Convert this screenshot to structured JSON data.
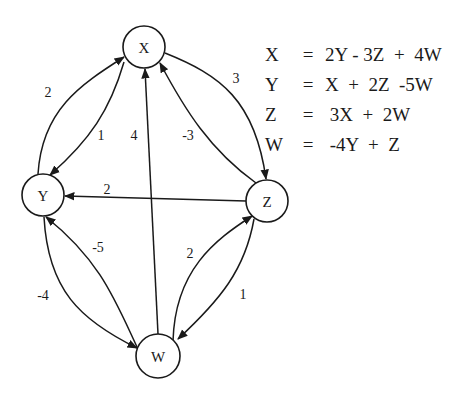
{
  "diagram": {
    "type": "signal-flow-graph",
    "nodes": [
      {
        "id": "X",
        "label": "X",
        "cx": 144,
        "cy": 47,
        "r": 21
      },
      {
        "id": "Y",
        "label": "Y",
        "cx": 43,
        "cy": 195,
        "r": 21
      },
      {
        "id": "Z",
        "label": "Z",
        "cx": 267,
        "cy": 201,
        "r": 21
      },
      {
        "id": "W",
        "label": "W",
        "cx": 158,
        "cy": 356,
        "r": 22
      }
    ],
    "edges": [
      {
        "from": "Y",
        "to": "X",
        "weight": "2"
      },
      {
        "from": "X",
        "to": "Y",
        "weight": "1"
      },
      {
        "from": "W",
        "to": "X",
        "weight": "4"
      },
      {
        "from": "Z",
        "to": "X",
        "weight": "-3"
      },
      {
        "from": "X",
        "to": "Z",
        "weight": "3"
      },
      {
        "from": "Z",
        "to": "Y",
        "weight": "2"
      },
      {
        "from": "W",
        "to": "Y",
        "weight": "-5"
      },
      {
        "from": "Y",
        "to": "W",
        "weight": "-4"
      },
      {
        "from": "W",
        "to": "Z",
        "weight": "2"
      },
      {
        "from": "Z",
        "to": "W",
        "weight": "1"
      }
    ]
  },
  "equations": [
    {
      "lhs": "X",
      "eq": "=",
      "rhs": "2Y - 3Z  +  4W"
    },
    {
      "lhs": "Y",
      "eq": "=",
      "rhs": "X  +  2Z  -5W"
    },
    {
      "lhs": "Z",
      "eq": "=",
      "rhs": " 3X  +  2W"
    },
    {
      "lhs": "W",
      "eq": "=",
      "rhs": " -4Y  +  Z"
    }
  ],
  "colors": {
    "stroke": "#1a1a1a",
    "background": "#ffffff"
  }
}
